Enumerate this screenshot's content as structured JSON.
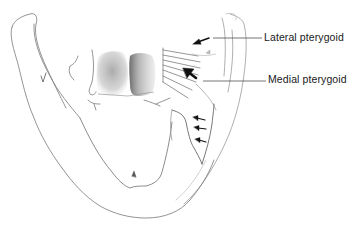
{
  "figure": {
    "labels": {
      "lateral_pterygoid": "Lateral pterygoid",
      "medial_pterygoid": "Medial pterygoid"
    },
    "colors": {
      "background": "#ffffff",
      "outline": "#6e6e6e",
      "leader_line": "#3a3a3a",
      "arrow": "#111111",
      "shading": "#9a9a9a",
      "label_text": "#1a1a1a"
    }
  }
}
